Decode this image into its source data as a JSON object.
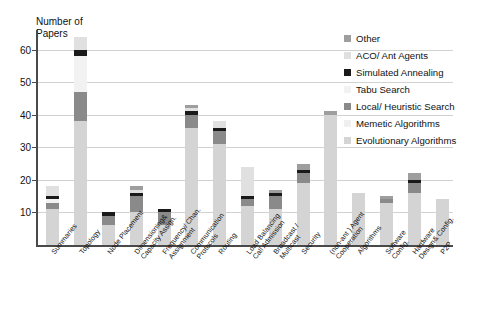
{
  "chart_data": {
    "type": "bar",
    "stacked": true,
    "title": "",
    "ylabel": "Number of\nPapers",
    "xlabel": "",
    "ylim": [
      0,
      66
    ],
    "yticks": [
      10,
      20,
      30,
      40,
      50,
      60
    ],
    "grid": true,
    "legend_position": "right",
    "categories": [
      "Summaries",
      "Topology",
      "Node Placement",
      "Dimensioning&\nCapacity Assign.",
      "Frequency/ Chan.\nAssignment",
      "Communication\nProtocols",
      "Routing",
      "Load Balancing\nCall Admission",
      "Broadcast /\nMulticast",
      "Security",
      "(non-ant ) Agent\nCooperation",
      "Algorithms",
      "Software\nConfig.",
      "Hardware\nDesign& Config.",
      "P2P"
    ],
    "series": [
      {
        "name": "Evolutionary Algorithms",
        "color": "#d4d4d4",
        "values": [
          11,
          38,
          6,
          10,
          6,
          36,
          31,
          12,
          11,
          19,
          40,
          16,
          13,
          16,
          14
        ]
      },
      {
        "name": "Memetic Algorithms",
        "color": "#efefef",
        "values": [
          0,
          0,
          0,
          0,
          0,
          0,
          0,
          0,
          0,
          0,
          0,
          0,
          0,
          0,
          0
        ]
      },
      {
        "name": "Local/ Heuristic Search",
        "color": "#8a8a8a",
        "values": [
          2,
          9,
          3,
          5,
          4,
          4,
          4,
          2,
          4,
          3,
          0,
          0,
          1,
          3,
          0
        ]
      },
      {
        "name": "Tabu Search",
        "color": "#f2f2f2",
        "values": [
          1,
          11,
          0,
          0,
          0,
          0,
          0,
          0,
          0,
          0,
          0,
          0,
          0,
          0,
          0
        ]
      },
      {
        "name": "Simulated Annealing",
        "color": "#1a1a1a",
        "values": [
          1,
          2,
          1,
          1,
          1,
          1,
          1,
          1,
          1,
          1,
          0,
          0,
          0,
          1,
          0
        ]
      },
      {
        "name": "ACO/ Ant Agents",
        "color": "#e0e0e0",
        "values": [
          3,
          4,
          0,
          1,
          0,
          1,
          2,
          9,
          0,
          0,
          0,
          0,
          0,
          0,
          0
        ]
      },
      {
        "name": "Other",
        "color": "#9e9e9e",
        "values": [
          0,
          0,
          0,
          1,
          0,
          1,
          0,
          0,
          1,
          2,
          1,
          0,
          1,
          2,
          0
        ]
      }
    ],
    "totals": [
      18,
      64,
      10,
      18,
      11,
      43,
      38,
      24,
      17,
      25,
      41,
      16,
      15,
      22,
      14
    ]
  },
  "legend": {
    "items": [
      {
        "label": "Other",
        "color": "#9e9e9e"
      },
      {
        "label": "ACO/ Ant Agents",
        "color": "#e0e0e0"
      },
      {
        "label": "Simulated Annealing",
        "color": "#1a1a1a"
      },
      {
        "label": "Tabu Search",
        "color": "#f2f2f2"
      },
      {
        "label": "Local/ Heuristic Search",
        "color": "#8a8a8a"
      },
      {
        "label": "Memetic Algorithms",
        "color": "#efefef"
      },
      {
        "label": "Evolutionary Algorithms",
        "color": "#d4d4d4"
      }
    ]
  },
  "axis": {
    "y_title": "Number of\nPapers",
    "y_tick_labels": [
      "10",
      "20",
      "30",
      "40",
      "50",
      "60"
    ]
  }
}
